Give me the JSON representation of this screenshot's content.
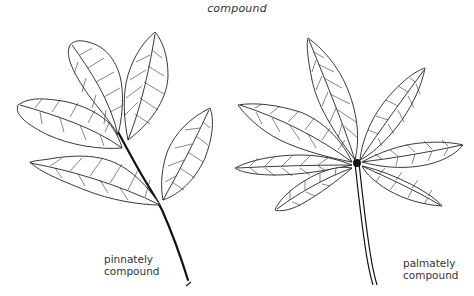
{
  "figure": {
    "title": "compound",
    "panels": [
      {
        "id": "pinnate",
        "label_line1": "pinnately",
        "label_line2": "compound",
        "description": "Pinnately compound leaf with five serrated leaflets arranged along a central rachis"
      },
      {
        "id": "palmate",
        "label_line1": "palmately",
        "label_line2": "compound",
        "description": "Palmately compound leaf with seven lanceolate leaflets radiating from a single point atop a long petiole"
      }
    ],
    "colors": {
      "background": "#ffffff",
      "ink": "#222222"
    }
  }
}
